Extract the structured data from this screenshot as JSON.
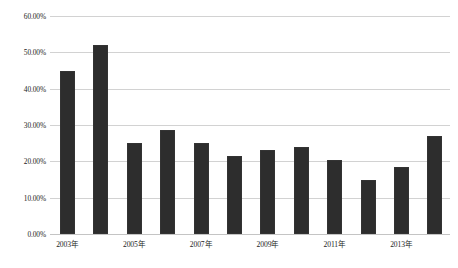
{
  "chart_data": {
    "type": "bar",
    "title": "",
    "xlabel": "",
    "ylabel": "",
    "ylim": [
      0,
      60
    ],
    "ytick_values": [
      0,
      10,
      20,
      30,
      40,
      50,
      60
    ],
    "ytick_labels": [
      "0.00%",
      "10.00%",
      "20.00%",
      "30.00%",
      "40.00%",
      "50.00%",
      "60.00%"
    ],
    "grid": true,
    "legend": "none",
    "categories": [
      "2003年",
      "2004年",
      "2005年",
      "2006年",
      "2007年",
      "2008年",
      "2009年",
      "2010年",
      "2011年",
      "2012年",
      "2013年",
      "2014年"
    ],
    "visible_xtick_labels": [
      "2003年",
      "2005年",
      "2007年",
      "2009年",
      "2011年",
      "2013年"
    ],
    "visible_xtick_indices": [
      0,
      2,
      4,
      6,
      8,
      10
    ],
    "values": [
      45.0,
      52.0,
      25.0,
      28.5,
      25.0,
      21.5,
      23.0,
      24.0,
      20.5,
      15.0,
      18.5,
      27.0
    ],
    "series": [
      {
        "name": "",
        "values": [
          45.0,
          52.0,
          25.0,
          28.5,
          25.0,
          21.5,
          23.0,
          24.0,
          20.5,
          15.0,
          18.5,
          27.0
        ]
      }
    ],
    "colors": {
      "bar": "#2d2d2d",
      "gridline": "#d2d2d2",
      "axis": "#c4c4c4",
      "text": "#1c1c1c",
      "background": "#ffffff"
    }
  }
}
